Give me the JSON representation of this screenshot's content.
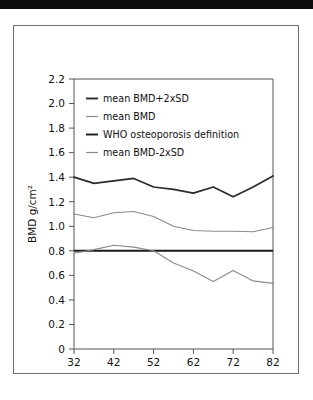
{
  "figure": {
    "top_bar_color": "#0d0d0d",
    "frame_border_color": "#6e6e6e",
    "background_color": "#ffffff"
  },
  "chart_data": {
    "type": "line",
    "title": "",
    "xlabel": "age (years)",
    "ylabel": "BMD g/cm2",
    "ylabel_display": "BMD g/cm²",
    "xlim": [
      32,
      82
    ],
    "ylim": [
      0,
      2.2
    ],
    "grid": false,
    "legend_position": "upper-left-inside",
    "xticks": [
      32,
      42,
      52,
      62,
      72,
      82
    ],
    "xtick_labels": [
      "32",
      "42",
      "52",
      "62",
      "72",
      "82"
    ],
    "yticks": [
      0,
      0.2,
      0.4,
      0.6,
      0.8,
      1.0,
      1.2,
      1.4,
      1.6,
      1.8,
      2.0,
      2.2
    ],
    "ytick_labels": [
      "0",
      "0.2",
      "0.4",
      "0.6",
      "0.8",
      "1.0",
      "1.2",
      "1.4",
      "1.6",
      "1.8",
      "2.0",
      "2.2"
    ],
    "x": [
      32,
      37,
      42,
      47,
      52,
      57,
      62,
      67,
      72,
      77,
      82
    ],
    "series": [
      {
        "name": "mean BMD+2xSD",
        "color": "#2b2b2b",
        "style": "thick",
        "values": [
          1.4,
          1.35,
          1.37,
          1.39,
          1.32,
          1.3,
          1.27,
          1.32,
          1.24,
          1.32,
          1.41
        ]
      },
      {
        "name": "mean BMD",
        "color": "#8a8a8a",
        "style": "thin",
        "values": [
          1.1,
          1.07,
          1.11,
          1.12,
          1.08,
          1.0,
          0.965,
          0.96,
          0.96,
          0.955,
          0.99
        ]
      },
      {
        "name": "WHO osteoporosis definition",
        "color": "#1a1a1a",
        "style": "thick",
        "constant": 0.8,
        "values": [
          0.8,
          0.8,
          0.8,
          0.8,
          0.8,
          0.8,
          0.8,
          0.8,
          0.8,
          0.8,
          0.8
        ]
      },
      {
        "name": "mean BMD-2xSD",
        "color": "#8a8a8a",
        "style": "thin",
        "values": [
          0.78,
          0.81,
          0.845,
          0.83,
          0.8,
          0.7,
          0.635,
          0.55,
          0.64,
          0.555,
          0.535
        ]
      }
    ],
    "legend": [
      {
        "label": "mean BMD+2xSD",
        "color": "#2b2b2b",
        "style": "thick"
      },
      {
        "label": "mean BMD",
        "color": "#8a8a8a",
        "style": "thin"
      },
      {
        "label": "WHO osteoporosis definition",
        "color": "#1a1a1a",
        "style": "thick"
      },
      {
        "label": "mean BMD-2xSD",
        "color": "#8a8a8a",
        "style": "thin"
      }
    ]
  }
}
